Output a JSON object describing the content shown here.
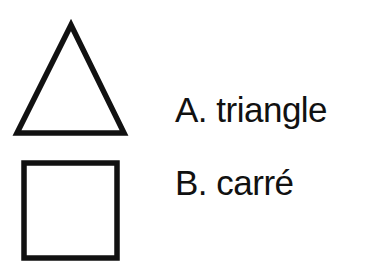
{
  "items": [
    {
      "letter": "A.",
      "name": "triangle",
      "text": "A. triangle",
      "shape": "triangle-icon"
    },
    {
      "letter": "B.",
      "name": "carré",
      "text": "B. carré",
      "shape": "square-icon"
    }
  ],
  "colors": {
    "stroke": "#111111",
    "background": "#ffffff"
  }
}
